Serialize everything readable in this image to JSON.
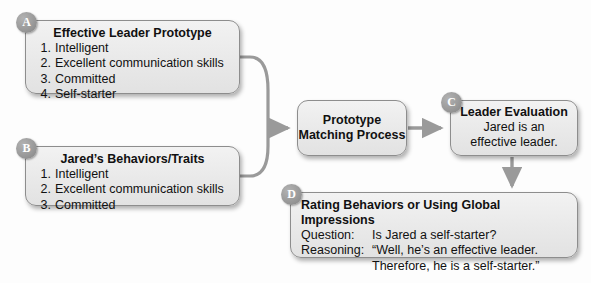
{
  "diagram": {
    "connector_color": "#9a9a9a",
    "node_fill": "#eaeaea",
    "node_border": "#8d8d8d",
    "badge_color": "#8f8f8f",
    "badge_text_color": "#ffffff"
  },
  "nodes": {
    "a": {
      "badge": "A",
      "title": "Effective Leader Prototype",
      "items": [
        {
          "num": "1.",
          "text": "Intelligent"
        },
        {
          "num": "2.",
          "text": "Excellent communication skills"
        },
        {
          "num": "3.",
          "text": "Committed"
        },
        {
          "num": "4.",
          "text": "Self-starter"
        }
      ]
    },
    "b": {
      "badge": "B",
      "title": "Jared’s Behaviors/Traits",
      "items": [
        {
          "num": "1.",
          "text": "Intelligent"
        },
        {
          "num": "2.",
          "text": "Excellent communication skills"
        },
        {
          "num": "3.",
          "text": "Committed"
        }
      ]
    },
    "process": {
      "line1": "Prototype",
      "line2": "Matching Process"
    },
    "c": {
      "badge": "C",
      "title": "Leader Evaluation",
      "line1": "Jared is an",
      "line2": "effective leader."
    },
    "d": {
      "badge": "D",
      "title": "Rating Behaviors or Using Global Impressions",
      "rows": [
        {
          "label": "Question:",
          "value": "Is Jared a self-starter?"
        },
        {
          "label": "Reasoning:",
          "value": "“Well, he’s an effective leader."
        },
        {
          "label": "Reasoning:",
          "value": "Therefore, he is a self-starter.”"
        }
      ]
    }
  }
}
